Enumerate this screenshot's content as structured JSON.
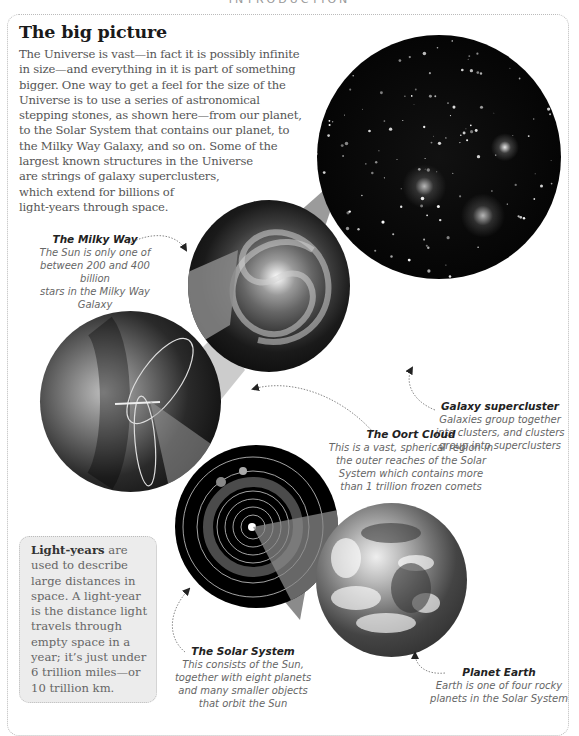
{
  "running_head": "INTRODUCTION",
  "title": "The big picture",
  "intro_lines": [
    "The Universe is vast—in fact it is possibly infinite",
    "in size—and everything in it is part of something",
    "bigger. One way to get a feel for the size of the",
    "Universe is to use a series of astronomical",
    "stepping stones, as shown here—from our planet,",
    "to the Solar System that contains our planet, to",
    "the Milky Way Galaxy, and so on. Some of the",
    "largest known structures in the Universe",
    "are strings of galaxy superclusters,",
    "which extend for billions of",
    "light-years through space."
  ],
  "images": {
    "galaxy_supercluster": "galaxy-supercluster-image",
    "milky_way": "milky-way-image",
    "oort_cloud": "oort-cloud-image",
    "solar_system": "solar-system-image",
    "planet_earth": "planet-earth-image"
  },
  "captions": {
    "milky_way": {
      "title": "The Milky Way",
      "lines": [
        "The Sun is only one of",
        "between 200 and 400 billion",
        "stars in the Milky Way Galaxy"
      ]
    },
    "galaxy_supercluster": {
      "title": "Galaxy supercluster",
      "lines": [
        "Galaxies group together",
        "into clusters, and clusters",
        "group into superclusters"
      ]
    },
    "oort_cloud": {
      "title": "The Oort Cloud",
      "lines": [
        "This is a vast, spherical region in",
        "the outer reaches of the Solar",
        "System which contains more",
        "than 1 trillion frozen comets"
      ]
    },
    "solar_system": {
      "title": "The Solar System",
      "lines": [
        "This consists of the Sun,",
        "together with eight planets",
        "and many smaller objects",
        "that orbit the Sun"
      ]
    },
    "planet_earth": {
      "title": "Planet Earth",
      "lines": [
        "Earth is one of four rocky",
        "planets in the Solar System"
      ]
    }
  },
  "note": {
    "bold": "Light-years",
    "first_rest": " are",
    "lines": [
      "used to describe",
      "large distances in",
      "space. A light-year",
      "is the distance light",
      "travels through",
      "empty space in a",
      "year; it’s just under",
      "6 trillion miles—or",
      "10 trillion km."
    ]
  },
  "colors": {
    "title": "#1a1a1a",
    "body_text": "#555555",
    "caption_text": "#666666",
    "note_bg": "#ececec",
    "cone": "#8a8a8a"
  }
}
